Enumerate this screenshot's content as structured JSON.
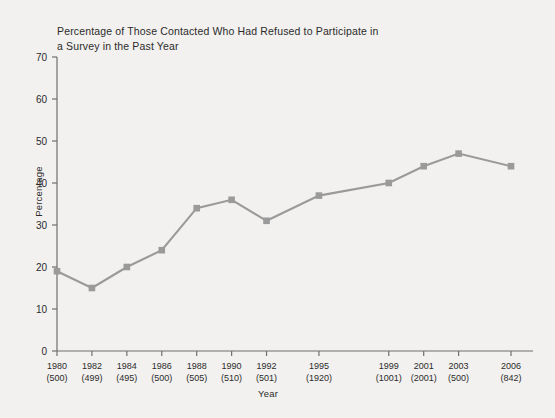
{
  "chart_data": {
    "type": "line",
    "title": "Percentage of Those Contacted Who Had Refused to Participate in a Survey in the Past Year",
    "xlabel": "Year",
    "ylabel": "Percentage",
    "ylim": [
      0,
      70
    ],
    "ytick_labels": [
      "0",
      "10",
      "20",
      "30",
      "40",
      "50",
      "60",
      "70"
    ],
    "yticks": [
      0,
      10,
      20,
      30,
      40,
      50,
      60,
      70
    ],
    "grid": false,
    "legend": "none",
    "marker": "square",
    "line_color": "#9a9a9a",
    "marker_color": "#9a9a9a",
    "categories": [
      "1980",
      "1982",
      "1984",
      "1986",
      "1988",
      "1990",
      "1992",
      "1995",
      "1999",
      "2001",
      "2003",
      "2006"
    ],
    "sample_sizes": [
      "(500)",
      "(499)",
      "(495)",
      "(500)",
      "(505)",
      "(510)",
      "(501)",
      "(1920)",
      "(1001)",
      "(2001)",
      "(500)",
      "(842)"
    ],
    "x": [
      1980,
      1982,
      1984,
      1986,
      1988,
      1990,
      1992,
      1995,
      1999,
      2001,
      2003,
      2006
    ],
    "values": [
      19,
      15,
      20,
      24,
      34,
      36,
      31,
      37,
      40,
      44,
      47,
      44
    ]
  }
}
